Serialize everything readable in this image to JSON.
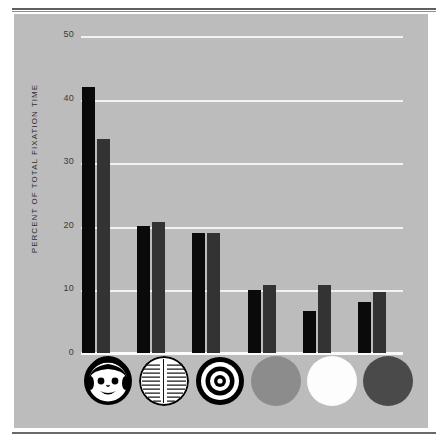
{
  "figure": {
    "background_color": "#ffffff",
    "panel_color": "#bcbcbc",
    "rule_color": "#5f5f5f"
  },
  "chart_data": {
    "type": "bar",
    "title": "",
    "subtitle": "",
    "xlabel": "",
    "ylabel": "PERCENT OF TOTAL FIXATION TIME",
    "ylim": [
      0,
      50
    ],
    "yticks": [
      0,
      10,
      20,
      30,
      40,
      50
    ],
    "ytick_labels": [
      "0",
      "10",
      "20",
      "30",
      "40",
      "50"
    ],
    "grid": true,
    "grid_color": "#f2f2f2",
    "legend": "none",
    "categories": [
      "face",
      "newsprint",
      "bullseye",
      "red-disc",
      "white-disc",
      "yellow-disc"
    ],
    "category_glyphs": [
      "face-pattern-icon",
      "newsprint-pattern-icon",
      "bullseye-pattern-icon",
      "red-disc-icon",
      "white-disc-icon",
      "yellow-disc-icon"
    ],
    "series": [
      {
        "name": "2 to 3 months old",
        "color": "#0a0a0a",
        "values": [
          42.0,
          20.0,
          19.0,
          10.0,
          6.6,
          8.0
        ]
      },
      {
        "name": "over 3 months old",
        "color": "#333333",
        "values": [
          33.8,
          20.6,
          19.0,
          10.7,
          10.7,
          9.6
        ]
      }
    ]
  },
  "axis": {
    "tick_0": "0",
    "tick_10": "10",
    "tick_20": "20",
    "tick_30": "30",
    "tick_40": "40",
    "tick_50": "50",
    "y_axis_title": "PERCENT OF TOTAL FIXATION TIME"
  }
}
